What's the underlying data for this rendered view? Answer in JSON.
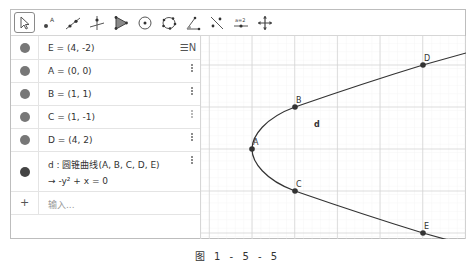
{
  "toolbar": {
    "tools": [
      {
        "name": "move-tool",
        "active": true
      },
      {
        "name": "point-tool"
      },
      {
        "name": "line-tool"
      },
      {
        "name": "perpendicular-line-tool"
      },
      {
        "name": "polygon-tool"
      },
      {
        "name": "circle-center-point-tool"
      },
      {
        "name": "conic-five-points-tool"
      },
      {
        "name": "angle-tool"
      },
      {
        "name": "reflect-about-line-tool"
      },
      {
        "name": "slider-tool",
        "label": "a=2"
      },
      {
        "name": "move-graphics-view-tool"
      }
    ]
  },
  "algebra": {
    "sort_button_label": "☰N",
    "rows": [
      {
        "text": "E = (4, -2)"
      },
      {
        "text": "A = (0, 0)"
      },
      {
        "text": "B = (1, 1)"
      },
      {
        "text": "C = (1, -1)"
      },
      {
        "text": "D = (4, 2)"
      }
    ],
    "conic": {
      "definition": "d : 圆锥曲线(A, B, C, D, E)",
      "result": "→  -y² + x = 0"
    },
    "input": {
      "plus": "+",
      "placeholder": "输入..."
    }
  },
  "graphics": {
    "points": [
      {
        "label": "A",
        "x": 0,
        "y": 0
      },
      {
        "label": "B",
        "x": 1,
        "y": 1
      },
      {
        "label": "C",
        "x": 1,
        "y": -1
      },
      {
        "label": "D",
        "x": 4,
        "y": 2
      },
      {
        "label": "E",
        "x": 4,
        "y": -2
      }
    ],
    "curve_label": "d",
    "curve_equation": "-y² + x = 0"
  },
  "caption": "图 1 - 5 - 5"
}
